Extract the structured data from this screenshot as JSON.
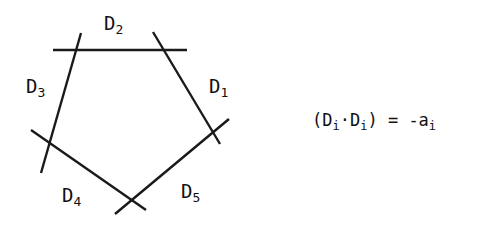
{
  "diagram": {
    "type": "pentagon of curves",
    "lines": [
      {
        "name": "D1",
        "x1": 153,
        "y1": 32,
        "x2": 220,
        "y2": 144
      },
      {
        "name": "D2",
        "x1": 53,
        "y1": 50,
        "x2": 187,
        "y2": 50
      },
      {
        "name": "D3",
        "x1": 81,
        "y1": 33,
        "x2": 41,
        "y2": 173
      },
      {
        "name": "D4",
        "x1": 31,
        "y1": 130,
        "x2": 146,
        "y2": 210
      },
      {
        "name": "D5",
        "x1": 229,
        "y1": 119,
        "x2": 115,
        "y2": 214
      }
    ],
    "labels": [
      {
        "base": "D",
        "sub": "1"
      },
      {
        "base": "D",
        "sub": "2"
      },
      {
        "base": "D",
        "sub": "3"
      },
      {
        "base": "D",
        "sub": "4"
      },
      {
        "base": "D",
        "sub": "5"
      }
    ],
    "stroke_color": "#1a1a1a"
  },
  "formula": {
    "open": "(D",
    "sub1": "i",
    "dot": "·D",
    "sub2": "i",
    "close": ") = -a",
    "sub3": "i"
  }
}
